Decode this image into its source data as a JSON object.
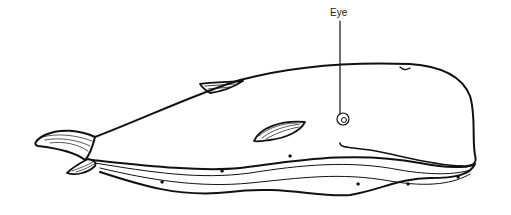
{
  "diagram": {
    "labels": [
      {
        "text": "Eye",
        "target": "eye"
      }
    ]
  }
}
